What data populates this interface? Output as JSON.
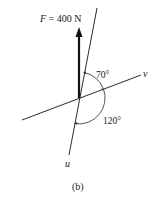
{
  "figure": {
    "caption": "(b)",
    "colors": {
      "line": "#2a2a2a",
      "force": "#111111",
      "background": "#ffffff"
    },
    "force": {
      "symbol": "F",
      "equals": " = 400 N",
      "magnitude": 400,
      "unit": "N",
      "direction": "vertical-up"
    },
    "axes": {
      "u": {
        "label": "u"
      },
      "v": {
        "label": "v"
      }
    },
    "angles": [
      {
        "label": "70°",
        "between": "F and v"
      },
      {
        "label": "120°",
        "between": "v and u"
      }
    ]
  }
}
